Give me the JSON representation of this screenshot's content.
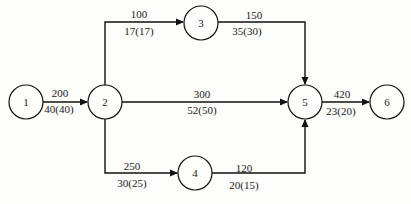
{
  "diagram": {
    "type": "network-flow",
    "nodes": [
      {
        "id": "1",
        "label": "1",
        "cx": 26,
        "cy": 102
      },
      {
        "id": "2",
        "label": "2",
        "cx": 105,
        "cy": 102
      },
      {
        "id": "3",
        "label": "3",
        "cx": 201,
        "cy": 23
      },
      {
        "id": "4",
        "label": "4",
        "cx": 195,
        "cy": 173
      },
      {
        "id": "5",
        "label": "5",
        "cx": 305,
        "cy": 102
      },
      {
        "id": "6",
        "label": "6",
        "cx": 387,
        "cy": 102
      }
    ],
    "edges": [
      {
        "from": "1",
        "to": "2",
        "top": "200",
        "bottom": "40(40)"
      },
      {
        "from": "2",
        "to": "3",
        "top": "100",
        "bottom": "17(17)"
      },
      {
        "from": "2",
        "to": "5",
        "top": "300",
        "bottom": "52(50)"
      },
      {
        "from": "2",
        "to": "4",
        "top": "250",
        "bottom": "30(25)"
      },
      {
        "from": "3",
        "to": "5",
        "top": "150",
        "bottom": "35(30)"
      },
      {
        "from": "4",
        "to": "5",
        "top": "120",
        "bottom": "20(15)"
      },
      {
        "from": "5",
        "to": "6",
        "top": "420",
        "bottom": "23(20)"
      }
    ]
  }
}
